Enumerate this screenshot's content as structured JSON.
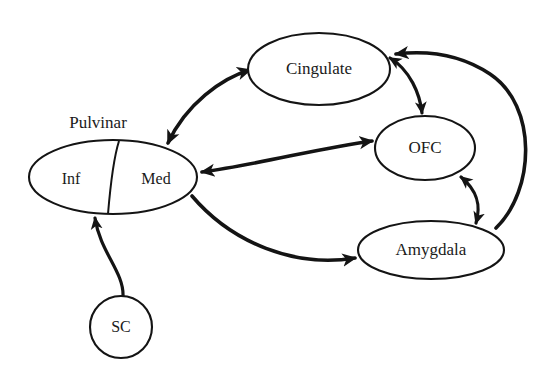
{
  "diagram": {
    "type": "node-link-connectivity-diagram",
    "background_color": "#ffffff",
    "stroke_color": "#141414",
    "width": 547,
    "height": 371,
    "group_labels": [
      {
        "id": "pulvinar-group-label",
        "text": "Pulvinar",
        "x": 98,
        "y": 124
      }
    ],
    "nodes": [
      {
        "id": "cingulate",
        "label": "Cingulate",
        "shape": "ellipse",
        "cx": 319,
        "cy": 69,
        "rx": 71,
        "ry": 36
      },
      {
        "id": "ofc",
        "label": "OFC",
        "shape": "ellipse",
        "cx": 425,
        "cy": 148,
        "rx": 50,
        "ry": 32
      },
      {
        "id": "amygdala",
        "label": "Amygdala",
        "shape": "ellipse",
        "cx": 431,
        "cy": 250,
        "rx": 73,
        "ry": 29
      },
      {
        "id": "pulvinar",
        "label": "",
        "shape": "ellipse-split",
        "cx": 113,
        "cy": 177,
        "rx": 84,
        "ry": 37,
        "subregions": [
          {
            "id": "pulvinar-inf",
            "label": "Inf",
            "x": 71,
            "y": 180
          },
          {
            "id": "pulvinar-med",
            "label": "Med",
            "x": 156,
            "y": 180
          }
        ],
        "divider": "M 119 141 C 113 160, 110 190, 108 214"
      },
      {
        "id": "sc",
        "label": "SC",
        "shape": "circle",
        "cx": 121,
        "cy": 327,
        "rx": 31,
        "ry": 31
      }
    ],
    "edges": [
      {
        "id": "pulvinar-cingulate",
        "from": "pulvinar",
        "to": "cingulate",
        "direction": "bidirectional",
        "path": "M 168 143 C 186 104, 222 78, 250 70"
      },
      {
        "id": "pulvinar-ofc",
        "from": "pulvinar",
        "to": "ofc",
        "direction": "bidirectional",
        "path": "M 202 172 C 260 164, 320 148, 372 141"
      },
      {
        "id": "pulvinar-amygdala",
        "from": "pulvinar",
        "to": "amygdala",
        "direction": "forward",
        "path": "M 192 196 C 232 243, 295 268, 355 258"
      },
      {
        "id": "cingulate-ofc",
        "from": "cingulate",
        "to": "ofc",
        "direction": "bidirectional",
        "path": "M 390 58 C 410 70, 420 94, 422 113"
      },
      {
        "id": "ofc-amygdala",
        "from": "ofc",
        "to": "amygdala",
        "direction": "bidirectional",
        "path": "M 461 177 C 478 191, 481 206, 476 223"
      },
      {
        "id": "amygdala-cingulate",
        "from": "amygdala",
        "to": "cingulate",
        "direction": "forward",
        "path": "M 496 228 C 535 190, 538 106, 490 74 C 457 52, 421 51, 396 54"
      },
      {
        "id": "sc-pulvinar",
        "from": "sc",
        "to": "pulvinar",
        "direction": "forward",
        "path": "M 123 296 C 124 272, 100 252, 95 218"
      }
    ]
  }
}
